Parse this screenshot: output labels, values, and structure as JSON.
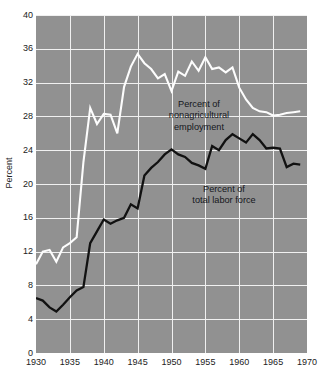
{
  "chart_data": {
    "type": "line",
    "title": "",
    "subtitle": "",
    "xlabel": "",
    "ylabel": "Percent",
    "xlim": [
      1930,
      1970
    ],
    "ylim": [
      0,
      40
    ],
    "xticks": [
      1930,
      1935,
      1940,
      1945,
      1950,
      1955,
      1960,
      1965,
      1970
    ],
    "yticks": [
      0,
      4,
      8,
      12,
      16,
      20,
      24,
      28,
      32,
      36,
      40
    ],
    "grid": true,
    "legend_position": "inline-annotations",
    "plot_background": "#919191",
    "gridline_color": "#f0f0f0",
    "annotations": [
      {
        "name": "nonagricultural",
        "lines": [
          "Percent of",
          "nonagricultural",
          "employment"
        ],
        "color": "#15171c"
      },
      {
        "name": "total-labor-force",
        "lines": [
          "Percent of",
          "total labor force"
        ],
        "color": "#15171c"
      }
    ],
    "x": [
      1930,
      1931,
      1932,
      1933,
      1934,
      1935,
      1936,
      1937,
      1938,
      1939,
      1940,
      1941,
      1942,
      1943,
      1944,
      1945,
      1946,
      1947,
      1948,
      1949,
      1950,
      1951,
      1952,
      1953,
      1954,
      1955,
      1956,
      1957,
      1958,
      1959,
      1960,
      1961,
      1962,
      1963,
      1964,
      1965,
      1966,
      1967,
      1968,
      1969
    ],
    "series": [
      {
        "name": "Percent of nonagricultural employment",
        "color": "#fdfdfd",
        "values": [
          10.5,
          12.0,
          12.2,
          10.8,
          12.5,
          13.0,
          13.7,
          22.6,
          29.0,
          27.1,
          28.3,
          28.2,
          26.0,
          31.5,
          33.9,
          35.4,
          34.3,
          33.6,
          32.5,
          33.0,
          31.0,
          33.3,
          32.8,
          34.5,
          33.4,
          35.0,
          33.6,
          33.8,
          33.2,
          33.8,
          31.4,
          30.0,
          29.0,
          28.6,
          28.5,
          28.1,
          28.2,
          28.4,
          28.5,
          28.6
        ],
        "style": "solid"
      },
      {
        "name": "Percent of total labor force",
        "color": "#111111",
        "values": [
          6.5,
          6.2,
          5.4,
          4.9,
          5.7,
          6.6,
          7.4,
          7.8,
          13.0,
          14.4,
          15.8,
          15.3,
          15.7,
          16.0,
          17.6,
          17.1,
          21.0,
          21.9,
          22.6,
          23.5,
          24.1,
          23.5,
          23.2,
          22.5,
          22.2,
          21.8,
          24.5,
          24.0,
          25.2,
          25.9,
          25.4,
          24.9,
          25.9,
          25.2,
          24.2,
          24.3,
          24.2,
          22.0,
          22.4,
          22.3
        ],
        "style": "solid"
      }
    ]
  },
  "axes": {
    "ylabel": "Percent",
    "ytick_labels": [
      "40",
      "36",
      "32",
      "28",
      "24",
      "20",
      "16",
      "12",
      "8",
      "4",
      "0"
    ],
    "xtick_labels": [
      "1930",
      "1935",
      "1940",
      "1945",
      "1950",
      "1955",
      "1960",
      "1965",
      "1970"
    ]
  }
}
